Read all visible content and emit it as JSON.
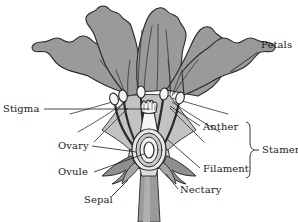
{
  "figure": {
    "type": "botanical-diagram",
    "background_color": "#ffffff",
    "petal_color": "#9a9a9a",
    "inner_petal_color": "#b5b5b5",
    "organ_fill_color": "#f2f2f2",
    "stem_color": "#9a9a9a",
    "outline_color": "#2a2a2a",
    "text_color": "#1b1b1b"
  },
  "labels": {
    "petals": "Petals",
    "stigma": "Stigma",
    "anther": "Anther",
    "filament": "Filament",
    "stamen": "Stamen",
    "ovary": "Ovary",
    "ovule": "Ovule",
    "sepal": "Sepal",
    "nectary": "Nectary"
  },
  "parts": [
    {
      "name": "petals",
      "label": "Petals",
      "group": "corolla"
    },
    {
      "name": "stigma",
      "label": "Stigma",
      "group": "pistil"
    },
    {
      "name": "ovary",
      "label": "Ovary",
      "group": "pistil"
    },
    {
      "name": "ovule",
      "label": "Ovule",
      "group": "pistil"
    },
    {
      "name": "anther",
      "label": "Anther",
      "group": "stamen"
    },
    {
      "name": "filament",
      "label": "Filament",
      "group": "stamen"
    },
    {
      "name": "stamen",
      "label": "Stamen",
      "group": "stamen"
    },
    {
      "name": "sepal",
      "label": "Sepal",
      "group": "calyx"
    },
    {
      "name": "nectary",
      "label": "Nectary",
      "group": "receptacle"
    }
  ]
}
